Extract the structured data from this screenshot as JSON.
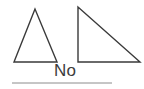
{
  "canvas": {
    "width": 144,
    "height": 89,
    "background_color": "#ffffff"
  },
  "colors": {
    "stroke": "#3a3a3a",
    "text": "#3c3c3c",
    "rule": "#8c8c8c"
  },
  "figure": {
    "label": "two-triangles-figure",
    "shapes": [
      {
        "name": "acute-isosceles-triangle",
        "kind": "triangle",
        "points": "35,9 14,62 57,62",
        "stroke_width": 1.4
      },
      {
        "name": "right-triangle",
        "kind": "triangle",
        "points": "78,7 78,62 140,62",
        "stroke_width": 1.4
      }
    ]
  },
  "answer": {
    "text": "No"
  },
  "divider": {
    "name": "horizontal-rule",
    "x1": 12,
    "x2": 112,
    "y": 83,
    "stroke_width": 1
  }
}
